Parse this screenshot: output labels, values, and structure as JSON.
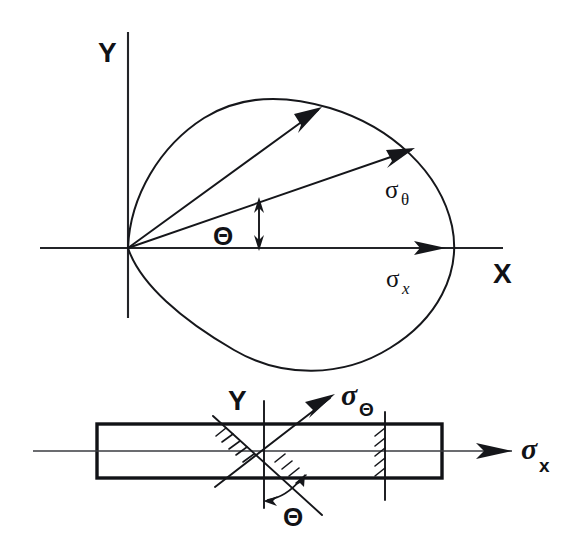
{
  "figure": {
    "background_color": "#ffffff",
    "ink_color": "#15161a"
  },
  "upper_diagram": {
    "name": "polar-stress-locus",
    "axis_y_label": "Y",
    "axis_x_label": "X",
    "angle_label": "Θ",
    "sigma_theta_symbol": "σ",
    "sigma_theta_subscript": "θ",
    "sigma_x_symbol": "σ",
    "sigma_x_subscript": "x",
    "origin": {
      "x": 128,
      "y": 248
    },
    "curve_description": "closed cardioid-like stress locus through origin",
    "vector_theta_angle_deg": 40,
    "vector_sigma_theta_angle_deg": 20,
    "vector_sigma_x_angle_deg": 0
  },
  "lower_diagram": {
    "name": "bar-with-inclined-section",
    "axis_y_label": "Y",
    "angle_label": "Θ",
    "sigma_theta_symbol": "σ",
    "sigma_theta_subscript": "Θ",
    "sigma_x_symbol": "σ",
    "sigma_x_subscript": "x",
    "bar": {
      "left": 97,
      "top": 424,
      "right": 442,
      "bottom": 478
    },
    "inclined_plane_angle_deg": 40,
    "hatching_sections": [
      "inclined-plane",
      "transverse-plane"
    ]
  }
}
